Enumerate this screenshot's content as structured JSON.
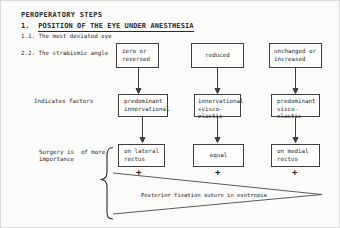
{
  "page": {
    "title": "PEROPERATORY STEPS",
    "section_number": "1.",
    "section_title": "POSITION OF THE EYE UNDER ANESTHESIA",
    "step_most_deviated": "1.1. The most deviated eye",
    "step_strabismic_angle": "2.2. The strabismic angle"
  },
  "row_labels": {
    "factors": "Indicates factors",
    "surgery_line1": "Surgery is  of more",
    "surgery_line2": "importance"
  },
  "flowchart": {
    "angle_boxes": [
      {
        "lines": [
          "zero or",
          "reversed"
        ]
      },
      {
        "lines": [
          "reduced"
        ]
      },
      {
        "lines": [
          "unchanged or",
          "increased"
        ]
      }
    ],
    "factor_boxes": [
      {
        "lines": [
          "predominant",
          "innervational"
        ]
      },
      {
        "lines": [
          "innervational",
          "+visco-elastic"
        ]
      },
      {
        "lines": [
          "predominant",
          "visco-elastic"
        ]
      }
    ],
    "surgery_boxes": [
      {
        "lines": [
          "on lateral",
          "rectus"
        ]
      },
      {
        "lines": [
          "equal"
        ]
      },
      {
        "lines": [
          "on medial",
          "rectus"
        ]
      }
    ],
    "plus_sign": "+",
    "wedge_label": "Posterior fixation suture in esotropia"
  },
  "colors": {
    "ink": "#2b2b2b",
    "box_border": "#3f3f3f",
    "paper": "#fbfbfa"
  }
}
